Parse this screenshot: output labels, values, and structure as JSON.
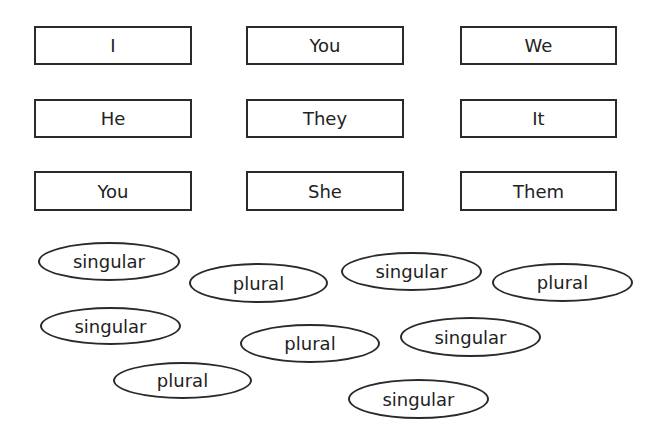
{
  "pronouns": [
    "I",
    "You",
    "We",
    "He",
    "They",
    "It",
    "You",
    "She",
    "Them"
  ],
  "labels": [
    "singular",
    "plural",
    "singular",
    "plural",
    "singular",
    "plural",
    "singular",
    "plural",
    "singular"
  ]
}
